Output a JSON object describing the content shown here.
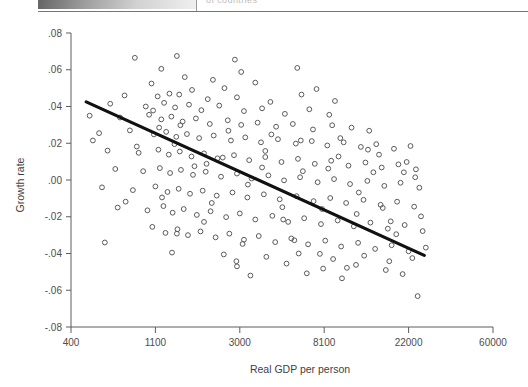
{
  "page_remnant": {
    "cut_off_text": "of countries"
  },
  "chart_data": {
    "type": "scatter",
    "title": "",
    "xlabel": "Real GDP per person",
    "ylabel": "Growth rate",
    "x_scale": "log",
    "x_tick_labels": [
      "400",
      "1100",
      "3000",
      "8100",
      "22000",
      "60000"
    ],
    "x_tick_values": [
      400,
      1100,
      3000,
      8100,
      22000,
      60000
    ],
    "y_tick_labels": [
      ".08",
      ".06",
      ".04",
      ".02",
      ".00",
      "-.02",
      "-.04",
      "-.06",
      "-.08"
    ],
    "y_tick_values": [
      0.08,
      0.06,
      0.04,
      0.02,
      0.0,
      -0.02,
      -0.04,
      -0.06,
      -0.08
    ],
    "ylim": [
      -0.08,
      0.08
    ],
    "grid": false,
    "legend": "none",
    "marker": "open-circle",
    "series": [
      {
        "name": "Countries",
        "points": [
          [
            860,
            0.0665
          ],
          [
            1180,
            0.0605
          ],
          [
            1420,
            0.0675
          ],
          [
            2830,
            0.0655
          ],
          [
            1560,
            0.056
          ],
          [
            2180,
            0.0545
          ],
          [
            5900,
            0.061
          ],
          [
            1050,
            0.0525
          ],
          [
            1700,
            0.049
          ],
          [
            2500,
            0.05
          ],
          [
            3600,
            0.053
          ],
          [
            7400,
            0.0495
          ],
          [
            760,
            0.046
          ],
          [
            1130,
            0.0455
          ],
          [
            1300,
            0.047
          ],
          [
            1460,
            0.0465
          ],
          [
            2050,
            0.044
          ],
          [
            2900,
            0.045
          ],
          [
            4300,
            0.0425
          ],
          [
            6200,
            0.0465
          ],
          [
            9200,
            0.043
          ],
          [
            640,
            0.0415
          ],
          [
            980,
            0.04
          ],
          [
            1220,
            0.042
          ],
          [
            1390,
            0.0395
          ],
          [
            1640,
            0.041
          ],
          [
            1900,
            0.038
          ],
          [
            2350,
            0.0405
          ],
          [
            3150,
            0.0375
          ],
          [
            3900,
            0.039
          ],
          [
            5100,
            0.036
          ],
          [
            6800,
            0.0385
          ],
          [
            8600,
            0.0355
          ],
          [
            500,
            0.035
          ],
          [
            720,
            0.034
          ],
          [
            1020,
            0.0355
          ],
          [
            1180,
            0.033
          ],
          [
            1330,
            0.0345
          ],
          [
            1520,
            0.0318
          ],
          [
            1780,
            0.0335
          ],
          [
            2100,
            0.0305
          ],
          [
            2600,
            0.0325
          ],
          [
            3050,
            0.03
          ],
          [
            3700,
            0.0312
          ],
          [
            4600,
            0.029
          ],
          [
            5600,
            0.0305
          ],
          [
            7100,
            0.0275
          ],
          [
            8900,
            0.0298
          ],
          [
            11200,
            0.0285
          ],
          [
            13800,
            0.0268
          ],
          [
            560,
            0.0255
          ],
          [
            810,
            0.027
          ],
          [
            1080,
            0.0248
          ],
          [
            1250,
            0.0262
          ],
          [
            1410,
            0.0235
          ],
          [
            1600,
            0.025
          ],
          [
            1850,
            0.0228
          ],
          [
            2200,
            0.0242
          ],
          [
            2700,
            0.0215
          ],
          [
            3200,
            0.0232
          ],
          [
            3850,
            0.0205
          ],
          [
            4700,
            0.0222
          ],
          [
            5800,
            0.0198
          ],
          [
            7000,
            0.0212
          ],
          [
            8400,
            0.0188
          ],
          [
            10200,
            0.0205
          ],
          [
            12500,
            0.018
          ],
          [
            15000,
            0.0195
          ],
          [
            18500,
            0.017
          ],
          [
            22500,
            0.0185
          ],
          [
            620,
            0.016
          ],
          [
            900,
            0.0148
          ],
          [
            1140,
            0.0165
          ],
          [
            1290,
            0.0138
          ],
          [
            1470,
            0.0155
          ],
          [
            1690,
            0.0128
          ],
          [
            1960,
            0.0145
          ],
          [
            2300,
            0.0118
          ],
          [
            2800,
            0.0135
          ],
          [
            3350,
            0.0108
          ],
          [
            4050,
            0.0125
          ],
          [
            4900,
            0.0098
          ],
          [
            5950,
            0.0115
          ],
          [
            7250,
            0.0088
          ],
          [
            8800,
            0.0105
          ],
          [
            10800,
            0.0078
          ],
          [
            13200,
            0.0095
          ],
          [
            16000,
            0.0068
          ],
          [
            19500,
            0.0085
          ],
          [
            24000,
            0.0058
          ],
          [
            680,
            0.006
          ],
          [
            950,
            0.0048
          ],
          [
            1160,
            0.0065
          ],
          [
            1310,
            0.0038
          ],
          [
            1490,
            0.0055
          ],
          [
            1720,
            0.0028
          ],
          [
            2000,
            0.0045
          ],
          [
            2400,
            0.0018
          ],
          [
            2900,
            0.0035
          ],
          [
            3450,
            0.0008
          ],
          [
            4200,
            0.0025
          ],
          [
            5050,
            -0.0002
          ],
          [
            6100,
            0.0015
          ],
          [
            7500,
            -0.0012
          ],
          [
            9100,
            0.0005
          ],
          [
            11000,
            -0.0022
          ],
          [
            13500,
            -0.0005
          ],
          [
            16500,
            -0.0032
          ],
          [
            20000,
            -0.0015
          ],
          [
            25000,
            -0.0042
          ],
          [
            580,
            -0.004
          ],
          [
            840,
            -0.0055
          ],
          [
            1100,
            -0.0035
          ],
          [
            1270,
            -0.0065
          ],
          [
            1450,
            -0.0048
          ],
          [
            1660,
            -0.0075
          ],
          [
            1930,
            -0.0058
          ],
          [
            2280,
            -0.0085
          ],
          [
            2750,
            -0.0068
          ],
          [
            3280,
            -0.0095
          ],
          [
            3980,
            -0.0078
          ],
          [
            4800,
            -0.0105
          ],
          [
            5850,
            -0.0088
          ],
          [
            7150,
            -0.0115
          ],
          [
            8700,
            -0.0098
          ],
          [
            10500,
            -0.0125
          ],
          [
            12900,
            -0.0108
          ],
          [
            15800,
            -0.0135
          ],
          [
            19200,
            -0.0118
          ],
          [
            23500,
            -0.0145
          ],
          [
            700,
            -0.015
          ],
          [
            1000,
            -0.0165
          ],
          [
            1210,
            -0.0142
          ],
          [
            1350,
            -0.0178
          ],
          [
            1540,
            -0.0158
          ],
          [
            1800,
            -0.019
          ],
          [
            2120,
            -0.017
          ],
          [
            2550,
            -0.0202
          ],
          [
            3000,
            -0.0182
          ],
          [
            3600,
            -0.0215
          ],
          [
            4400,
            -0.0195
          ],
          [
            5300,
            -0.0228
          ],
          [
            6400,
            -0.0208
          ],
          [
            7800,
            -0.024
          ],
          [
            9500,
            -0.022
          ],
          [
            11500,
            -0.0252
          ],
          [
            14000,
            -0.0232
          ],
          [
            17200,
            -0.0265
          ],
          [
            21000,
            -0.0245
          ],
          [
            26000,
            -0.0278
          ],
          [
            1060,
            -0.0255
          ],
          [
            1240,
            -0.0288
          ],
          [
            1430,
            -0.0268
          ],
          [
            1620,
            -0.03
          ],
          [
            1880,
            -0.028
          ],
          [
            2250,
            -0.0312
          ],
          [
            2650,
            -0.0292
          ],
          [
            3150,
            -0.0325
          ],
          [
            3750,
            -0.0305
          ],
          [
            4550,
            -0.0338
          ],
          [
            5500,
            -0.0318
          ],
          [
            6700,
            -0.035
          ],
          [
            8200,
            -0.033
          ],
          [
            9900,
            -0.0362
          ],
          [
            12100,
            -0.0342
          ],
          [
            14800,
            -0.0375
          ],
          [
            18000,
            -0.0355
          ],
          [
            22000,
            -0.0388
          ],
          [
            27000,
            -0.0368
          ],
          [
            600,
            -0.034
          ],
          [
            1340,
            -0.0395
          ],
          [
            2480,
            -0.0405
          ],
          [
            4100,
            -0.0418
          ],
          [
            6000,
            -0.04
          ],
          [
            9000,
            -0.043
          ],
          [
            13000,
            -0.0412
          ],
          [
            17500,
            -0.0442
          ],
          [
            23000,
            -0.0425
          ],
          [
            2900,
            -0.047
          ],
          [
            5200,
            -0.0455
          ],
          [
            8000,
            -0.0482
          ],
          [
            11800,
            -0.0462
          ],
          [
            16800,
            -0.049
          ],
          [
            3400,
            -0.052
          ],
          [
            6600,
            -0.0508
          ],
          [
            10000,
            -0.0535
          ],
          [
            20500,
            -0.0512
          ],
          [
            24500,
            -0.0632
          ],
          [
            1150,
            0.0285
          ],
          [
            1380,
            0.0195
          ],
          [
            1750,
            0.0075
          ],
          [
            2150,
            -0.0125
          ],
          [
            2620,
            0.0268
          ],
          [
            3300,
            -0.0025
          ],
          [
            4050,
            0.0158
          ],
          [
            5000,
            -0.0215
          ],
          [
            6300,
            0.0048
          ],
          [
            7900,
            -0.0158
          ],
          [
            9800,
            0.0228
          ],
          [
            12200,
            -0.0068
          ],
          [
            15500,
            0.0138
          ],
          [
            19000,
            -0.0295
          ],
          [
            23800,
            0.0015
          ],
          [
            880,
            0.0182
          ],
          [
            1190,
            -0.0095
          ],
          [
            1480,
            0.0298
          ],
          [
            1960,
            -0.0228
          ],
          [
            2450,
            0.0122
          ],
          [
            3100,
            -0.0348
          ],
          [
            3900,
            0.0068
          ],
          [
            4950,
            -0.0148
          ],
          [
            6150,
            0.0215
          ],
          [
            7700,
            -0.0402
          ],
          [
            9600,
            0.0128
          ],
          [
            11900,
            -0.0185
          ],
          [
            14500,
            0.0042
          ],
          [
            17800,
            -0.0225
          ],
          [
            21500,
            0.0098
          ],
          [
            520,
            0.0215
          ],
          [
            770,
            -0.0118
          ],
          [
            1070,
            0.0378
          ],
          [
            1420,
            -0.0292
          ],
          [
            2020,
            0.0088
          ],
          [
            2880,
            -0.0442
          ],
          [
            4350,
            0.0248
          ],
          [
            5700,
            -0.0328
          ],
          [
            8500,
            0.0062
          ],
          [
            10600,
            -0.0478
          ],
          [
            13600,
            0.0165
          ],
          [
            16200,
            -0.0152
          ],
          [
            20800,
            0.0042
          ],
          [
            25500,
            -0.0198
          ],
          [
            3050,
            0.0588
          ]
        ]
      }
    ],
    "fit_line": {
      "name": "Regression line",
      "x_start": 480,
      "y_start": 0.0425,
      "x_end": 26500,
      "y_end": -0.041
    }
  }
}
